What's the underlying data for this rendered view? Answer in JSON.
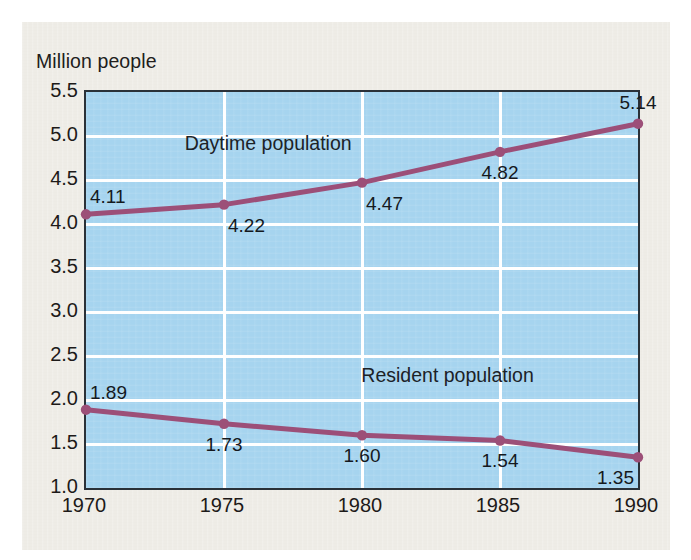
{
  "figure": {
    "axis_caption": "Million people",
    "background_color": "#eeece6",
    "plot_background_color": "#a6d4ef",
    "gridline_color": "#ffffff",
    "axis_color": "#2a3138",
    "series_color": "#9c4f78"
  },
  "chart_data": {
    "type": "line",
    "title": "",
    "subtitle": "",
    "xlabel": "",
    "ylabel": "Million people",
    "x": [
      1970,
      1975,
      1980,
      1985,
      1990
    ],
    "categories": [
      "1970",
      "1975",
      "1980",
      "1985",
      "1990"
    ],
    "xlim": [
      1970,
      1990
    ],
    "ylim": [
      1.0,
      5.5
    ],
    "ytick_labels": [
      "5.5",
      "5.0",
      "4.5",
      "4.0",
      "3.5",
      "3.0",
      "2.5",
      "2.0",
      "1.5",
      "1.0"
    ],
    "ytick_values": [
      5.5,
      5.0,
      4.5,
      4.0,
      3.5,
      3.0,
      2.5,
      2.0,
      1.5,
      1.0
    ],
    "grid": true,
    "legend_position": "inline-annotations",
    "series": [
      {
        "name": "Daytime population",
        "color": "#9c4f78",
        "values": [
          4.11,
          4.22,
          4.47,
          4.82,
          5.14
        ],
        "data_labels": [
          "4.11",
          "4.22",
          "4.47",
          "4.82",
          "5.14"
        ]
      },
      {
        "name": "Resident population",
        "color": "#9c4f78",
        "values": [
          1.89,
          1.73,
          1.6,
          1.54,
          1.35
        ],
        "data_labels": [
          "1.89",
          "1.73",
          "1.60",
          "1.54",
          "1.35"
        ]
      }
    ],
    "annotations": [
      {
        "text": "Daytime population",
        "x": 1976.6,
        "y": 4.92
      },
      {
        "text": "Resident population",
        "x": 1983.1,
        "y": 2.28
      }
    ]
  }
}
